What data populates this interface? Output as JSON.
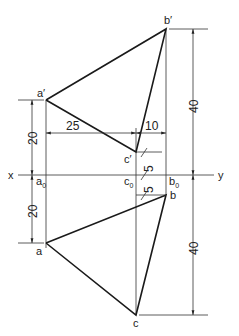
{
  "diagram": {
    "axis": {
      "left": "x",
      "right": "y"
    },
    "front_view": {
      "labels": {
        "a": "a′",
        "b": "b′",
        "c": "c′"
      }
    },
    "top_view": {
      "labels": {
        "a": "a",
        "b": "b",
        "c": "c"
      }
    },
    "axis_points": {
      "a0": {
        "base": "a",
        "sub": "0"
      },
      "c0": {
        "base": "c",
        "sub": "0"
      },
      "b0": {
        "base": "b",
        "sub": "0"
      }
    },
    "dimensions": {
      "a_prime_height": "20",
      "a_depth": "20",
      "b_prime_height": "40",
      "c_depth_total": "40",
      "ac_horizontal": "25",
      "cb_horizontal": "10",
      "c_prime_height": "5",
      "b_depth": "5"
    }
  }
}
